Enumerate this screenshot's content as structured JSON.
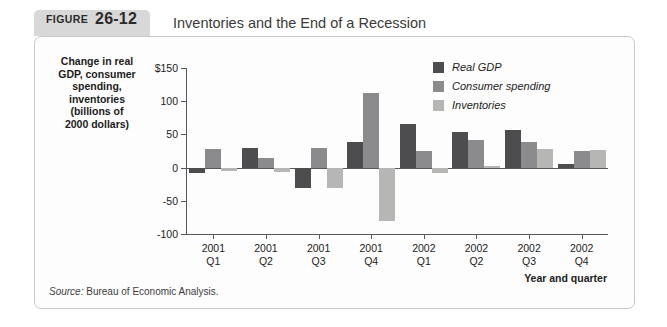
{
  "figure": {
    "tag_word": "FIGURE",
    "tag_number": "26-12",
    "title": "Inventories and the End of a Recession",
    "source_word": "Source:",
    "source_text": " Bureau of Economic Analysis."
  },
  "colors": {
    "real_gdp": "#4d4d4f",
    "consumer_spending": "#8b8b8d",
    "inventories": "#b6b6b4",
    "axis": "#58585a",
    "tag_background": "#d8d8d8",
    "panel_border": "#c9c9c9"
  },
  "chart_data": {
    "type": "bar",
    "title": "Inventories and the End of a Recession",
    "ylabel": "Change in real\nGDP, consumer\nspending,\ninventories\n(billions of\n2000 dollars)",
    "xlabel": "Year and quarter",
    "ylim": [
      -100,
      150
    ],
    "yticks": [
      150,
      100,
      50,
      0,
      -50,
      -100
    ],
    "ytick_labels": [
      "$150",
      "100",
      "50",
      "0",
      "-50",
      "-100"
    ],
    "grid": false,
    "legend_position": "top-right",
    "categories": [
      "2001 Q1",
      "2001 Q2",
      "2001 Q3",
      "2001 Q4",
      "2002 Q1",
      "2002 Q2",
      "2002 Q3",
      "2002 Q4"
    ],
    "category_years": [
      "2001",
      "2001",
      "2001",
      "2001",
      "2002",
      "2002",
      "2002",
      "2002"
    ],
    "category_quarters": [
      "Q1",
      "Q2",
      "Q3",
      "Q4",
      "Q1",
      "Q2",
      "Q3",
      "Q4"
    ],
    "series": [
      {
        "name": "Real GDP",
        "color": "#4d4d4f",
        "values": [
          -8,
          29,
          -31,
          38,
          65,
          53,
          57,
          5
        ]
      },
      {
        "name": "Consumer spending",
        "color": "#8b8b8d",
        "values": [
          28,
          15,
          30,
          113,
          25,
          42,
          38,
          25
        ]
      },
      {
        "name": "Inventories",
        "color": "#b6b6b4",
        "values": [
          -5,
          -6,
          -30,
          -80,
          -8,
          2,
          28,
          26
        ]
      }
    ]
  }
}
